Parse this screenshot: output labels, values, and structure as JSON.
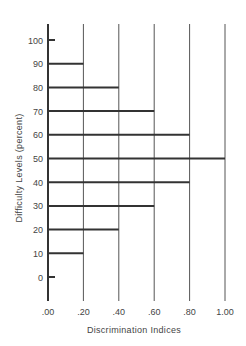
{
  "chart_data": {
    "type": "bar",
    "orientation": "horizontal",
    "title": "",
    "xlabel": "Discrimination Indices",
    "ylabel": "Difficulty Levels (percent)",
    "xlim": [
      0,
      1.0
    ],
    "ylim": [
      -10,
      105
    ],
    "x_ticks": [
      ".00",
      ".20",
      ".40",
      ".60",
      ".80",
      "1.00"
    ],
    "x_tick_values": [
      0,
      0.2,
      0.4,
      0.6,
      0.8,
      1.0
    ],
    "y_ticks": [
      "0",
      "10",
      "20",
      "30",
      "40",
      "50",
      "60",
      "70",
      "80",
      "90",
      "100"
    ],
    "y_tick_values": [
      0,
      10,
      20,
      30,
      40,
      50,
      60,
      70,
      80,
      90,
      100
    ],
    "categories": [
      0,
      10,
      20,
      30,
      40,
      50,
      60,
      70,
      80,
      90,
      100
    ],
    "values": [
      0.02,
      0.2,
      0.4,
      0.6,
      0.8,
      1.0,
      0.8,
      0.6,
      0.4,
      0.2,
      0.02
    ],
    "grid": "vertical lines at each x tick",
    "legend": null,
    "colors": {
      "lines": "#333333",
      "grid": "#555555",
      "text": "#444444"
    }
  }
}
